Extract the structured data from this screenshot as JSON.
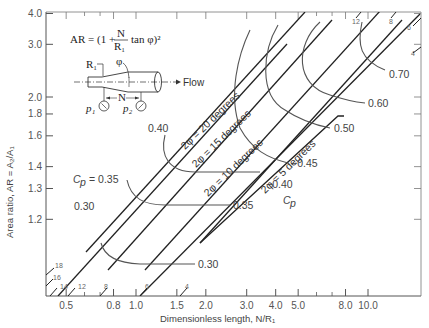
{
  "chart_data": {
    "type": "line",
    "title": "",
    "xlabel": "Dimensionless length, N/R₁",
    "ylabel": "Area ratio, AR = A₂/A₁",
    "x_scale": "log",
    "y_scale": "log(AR-1)",
    "xlim": [
      0.42,
      20
    ],
    "ylim": [
      1.1,
      4.0
    ],
    "x_ticks": [
      "0.5",
      "0.8",
      "1.0",
      "1.5",
      "2.0",
      "3.0",
      "4.0",
      "5.0",
      "8.0",
      "10.0"
    ],
    "y_ticks": [
      "1.2",
      "1.3",
      "1.4",
      "1.6",
      "1.8",
      "2.0",
      "3.0",
      "4.0"
    ],
    "grid": false,
    "formula": "AR = (1 + N/R₁ tan φ)²",
    "inset_labels": {
      "r1": "R₁",
      "phi": "φ",
      "flow": "Flow",
      "n": "N",
      "p1": "p₁",
      "p2": "p₂"
    },
    "angle_lines": [
      {
        "label": "2φ = 20 degrees",
        "two_phi_deg": 20
      },
      {
        "label": "2φ = 15 degrees",
        "two_phi_deg": 15
      },
      {
        "label": "2φ = 10 degrees",
        "two_phi_deg": 10
      },
      {
        "label": "2φ = 5 degrees",
        "two_phi_deg": 5
      }
    ],
    "edge_angle_marks": {
      "bottom": [
        "18",
        "16",
        "14",
        "12",
        "8",
        "6",
        "4"
      ],
      "top": [
        "12",
        "8",
        "6",
        "4"
      ]
    },
    "cp_contours": [
      {
        "label": "Cp = 0.35",
        "cp": 0.35,
        "points": [
          [
            0.8,
            1.4
          ],
          [
            0.9,
            1.33
          ],
          [
            1.1,
            1.3
          ],
          [
            2.5,
            1.3
          ],
          [
            4.3,
            1.3
          ]
        ]
      },
      {
        "label": "0.30",
        "cp": 0.3,
        "points": [
          [
            0.6,
            1.28
          ],
          [
            0.7,
            1.22
          ],
          [
            0.9,
            1.2
          ],
          [
            2.0,
            1.2
          ],
          [
            3.8,
            1.2
          ]
        ]
      },
      {
        "label": "0.40",
        "cp": 0.4,
        "points": [
          [
            1.5,
            1.75
          ],
          [
            1.25,
            1.5
          ],
          [
            1.3,
            1.4
          ],
          [
            1.6,
            1.35
          ],
          [
            3,
            1.35
          ],
          [
            5.3,
            1.35
          ]
        ]
      },
      {
        "label": "0.45",
        "cp": 0.45,
        "points": [
          [
            2.0,
            3.3
          ],
          [
            1.8,
            2.4
          ],
          [
            1.9,
            1.8
          ],
          [
            2.6,
            1.55
          ],
          [
            4.3,
            1.45
          ]
        ]
      },
      {
        "label": "0.50",
        "cp": 0.5,
        "points": [
          [
            3.0,
            3.5
          ],
          [
            2.7,
            2.6
          ],
          [
            3.0,
            2.0
          ],
          [
            4.5,
            1.65
          ],
          [
            6.8,
            1.6
          ]
        ]
      },
      {
        "label": "0.60",
        "cp": 0.6,
        "points": [
          [
            4.6,
            3.5
          ],
          [
            4.2,
            2.6
          ],
          [
            5.2,
            2.2
          ],
          [
            7.2,
            2.0
          ],
          [
            11.5,
            1.92
          ]
        ]
      },
      {
        "label": "0.70",
        "cp": 0.7,
        "points": [
          [
            7.3,
            3.55
          ],
          [
            7.4,
            2.9
          ],
          [
            9.5,
            2.55
          ],
          [
            12.5,
            2.4
          ]
        ]
      }
    ],
    "extra_labels": {
      "cp_symbol": "C_p"
    }
  },
  "ui": {
    "y_axis_title": "Area ratio, AR = A₂/A₁",
    "x_axis_title": "Dimensionless length, N/R₁"
  }
}
